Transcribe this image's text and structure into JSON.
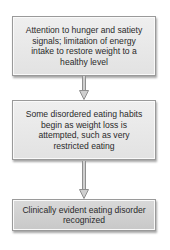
{
  "diagram": {
    "type": "flowchart",
    "direction": "top-to-bottom",
    "nodes": [
      {
        "id": "step1",
        "text": "Attention to hunger and satiety signals; limitation of energy intake to restore weight to a healthy level"
      },
      {
        "id": "step2",
        "text": "Some disordered eating habits begin as weight loss is attempted, such as very restricted eating"
      },
      {
        "id": "step3",
        "text": "Clinically evident eating disorder recognized"
      }
    ],
    "edges": [
      {
        "from": "step1",
        "to": "step2",
        "icon": "arrow-down-icon"
      },
      {
        "from": "step2",
        "to": "step3",
        "icon": "arrow-down-icon"
      }
    ],
    "colors": {
      "box_fill": "#e8e8e8",
      "box_fill_last": "#d0d0d0",
      "box_border": "#9a9a9a",
      "arrow_fill": "#cfcfcf",
      "text": "#2a2a2a"
    }
  }
}
